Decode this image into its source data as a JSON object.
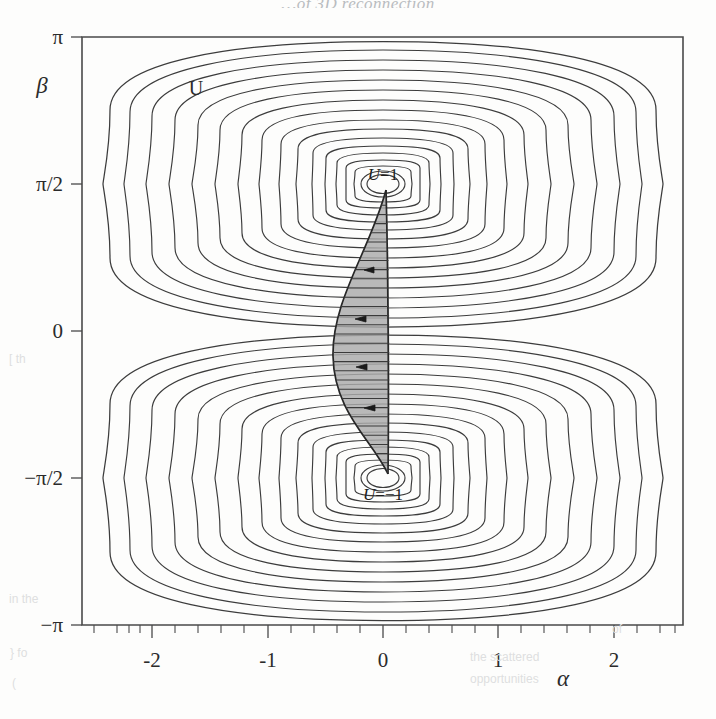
{
  "figure": {
    "title_partial": "…of 3D reconnection",
    "background_color": "#fdfdfc",
    "line_color": "#3c3c3c",
    "shade_color": "#a9a9a9"
  },
  "axes": {
    "x": {
      "label": "α",
      "ticks": [
        "-2",
        "-1",
        "0",
        "1",
        "2"
      ],
      "tick_values": [
        -2,
        -1,
        0,
        1,
        2
      ],
      "minor_per_interval": 4,
      "range": [
        -2.6,
        2.6
      ]
    },
    "y": {
      "label": "β",
      "ticks": [
        "π",
        "π/2",
        "0",
        "−π/2",
        "−π"
      ],
      "tick_values": [
        3.14159,
        1.5708,
        0,
        -1.5708,
        -3.14159
      ],
      "range": [
        -3.14159,
        3.14159
      ]
    }
  },
  "annotations": {
    "field_label": "U",
    "upper_center_label_u": "U",
    "upper_center_label_eq": "=1",
    "lower_center_label_u": "U",
    "lower_center_label_eq": "=−1"
  },
  "chart_data": {
    "type": "contour",
    "title": "",
    "xlabel": "α",
    "ylabel": "β",
    "xlim": [
      -2.6,
      2.6
    ],
    "ylim": [
      -3.14159,
      3.14159
    ],
    "grid": false,
    "legend": "none",
    "centers": [
      {
        "label": "U=1",
        "alpha": 0,
        "beta": 1.5708,
        "value": 1
      },
      {
        "label": "U=-1",
        "alpha": 0,
        "beta": -1.5708,
        "value": -1
      }
    ],
    "contour_levels_count_per_center": 20,
    "contour_level_step": 0.05,
    "shaded_region": {
      "name": "reconnection-flux-tube",
      "alpha_extent": [
        -0.35,
        0.02
      ],
      "beta_extent": [
        -1.5708,
        1.5708
      ],
      "arrow_direction": "left",
      "arrow_count": 4,
      "arrow_beta_positions": [
        0.93,
        0.17,
        -0.45,
        -1.0
      ]
    }
  },
  "scan_bleed": [
    {
      "text": "[ th",
      "x": 9,
      "y": 352
    },
    {
      "text": "in the",
      "x": 9,
      "y": 592
    },
    {
      "text": "} fo",
      "x": 10,
      "y": 646
    },
    {
      "text": "(",
      "x": 12,
      "y": 676
    },
    {
      "text": "the scattered",
      "x": 470,
      "y": 650
    },
    {
      "text": "opportunities",
      "x": 470,
      "y": 672
    },
    {
      "text": "of",
      "x": 612,
      "y": 622
    }
  ]
}
